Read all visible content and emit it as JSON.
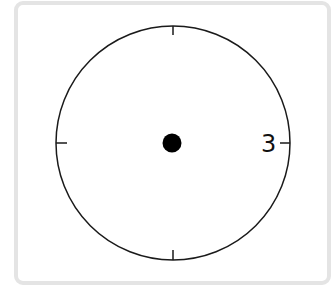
{
  "diagram": {
    "type": "clock-face",
    "frame": {
      "border_color": "#e4e4e4",
      "background": "#ffffff"
    },
    "dial": {
      "stroke_color": "#1a1a1a",
      "fill": "#ffffff"
    },
    "ticks": [
      "12",
      "3",
      "6",
      "9"
    ],
    "numerals": [
      {
        "position": "3 o'clock",
        "label": "3"
      }
    ],
    "center_dot": {
      "color": "#000000"
    },
    "hands": []
  }
}
